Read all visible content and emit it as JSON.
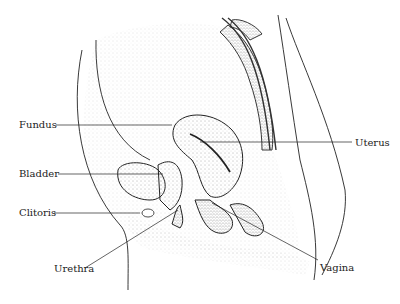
{
  "diagram": {
    "type": "anatomical-sagittal-section",
    "labels": [
      {
        "id": "fundus",
        "text": "Fundus",
        "x": 19,
        "y": 119,
        "line": [
          56,
          125,
          172,
          125
        ]
      },
      {
        "id": "uterus",
        "text": "Uterus",
        "x": 355,
        "y": 137,
        "line": [
          200,
          142,
          352,
          142
        ]
      },
      {
        "id": "bladder",
        "text": "Bladder",
        "x": 19,
        "y": 168,
        "line": [
          58,
          174,
          163,
          174
        ]
      },
      {
        "id": "clitoris",
        "text": "Clitoris",
        "x": 19,
        "y": 207,
        "line": [
          54,
          213,
          140,
          213
        ]
      },
      {
        "id": "urethra",
        "text": "Urethra",
        "x": 54,
        "y": 263,
        "line": [
          85,
          268,
          178,
          210
        ]
      },
      {
        "id": "vagina",
        "text": "Vagina",
        "x": 320,
        "y": 262,
        "line": [
          212,
          203,
          318,
          260
        ]
      }
    ],
    "colors": {
      "ink": "#222222",
      "stipple": "#9a9a9a",
      "background": "#ffffff"
    }
  }
}
